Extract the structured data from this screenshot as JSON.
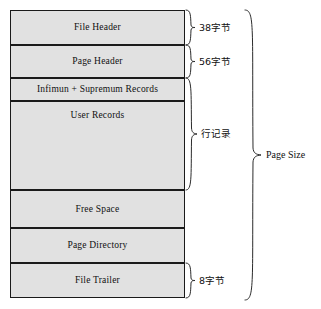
{
  "diagram": {
    "fill_color": "#e1e1e1",
    "border_color": "#1a1a1a",
    "background_color": "#ffffff",
    "sections": [
      {
        "label": "File Header"
      },
      {
        "label": "Page Header"
      },
      {
        "label": "Infimun + Supremum Records"
      },
      {
        "label": "User Records"
      },
      {
        "label": "Free Space"
      },
      {
        "label": "Page Directory"
      },
      {
        "label": "File Trailer"
      }
    ],
    "annotations": [
      {
        "label": "38字节",
        "target": "File Header"
      },
      {
        "label": "56字节",
        "target": "Page Header"
      },
      {
        "label": "行记录",
        "target": "Infimun + Supremum Records, User Records"
      },
      {
        "label": "8字节",
        "target": "File Trailer"
      },
      {
        "label": "Page Size",
        "target": "whole page"
      }
    ]
  }
}
